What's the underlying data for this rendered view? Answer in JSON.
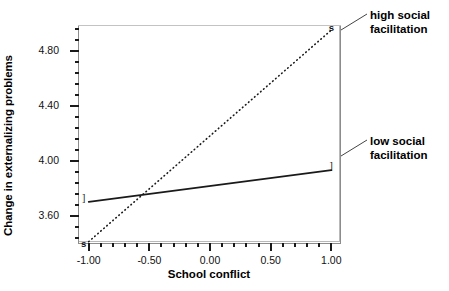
{
  "chart_data": {
    "type": "line",
    "title": "",
    "xlabel": "School conflict",
    "ylabel": "Change in externalizing problems",
    "xlim": [
      -1.08,
      1.08
    ],
    "ylim": [
      3.4,
      4.98
    ],
    "grid": false,
    "legend_position": "right-outside-annotations",
    "x": [
      -1.0,
      1.0
    ],
    "series": [
      {
        "name": "high social facilitation",
        "style": "dotted",
        "marker": "s",
        "values": [
          3.41,
          4.95
        ]
      },
      {
        "name": "low social facilitation",
        "style": "solid",
        "marker": "]",
        "values": [
          3.7,
          3.93
        ]
      }
    ],
    "xticks": [
      {
        "value": -1.0,
        "label": "-1.00"
      },
      {
        "value": -0.5,
        "label": "-0.50"
      },
      {
        "value": 0.0,
        "label": "0.00"
      },
      {
        "value": 0.5,
        "label": "0.50"
      },
      {
        "value": 1.0,
        "label": "1.00"
      }
    ],
    "yticks": [
      {
        "value": 4.8,
        "label": "4.80"
      },
      {
        "value": 4.4,
        "label": "4.40"
      },
      {
        "value": 4.0,
        "label": "4.00"
      },
      {
        "value": 3.6,
        "label": "3.60"
      }
    ],
    "x_minor_per_interval": 4,
    "y_minor_per_interval": 4
  },
  "axes": {
    "x_title": "School conflict",
    "y_title": "Change in externalizing problems"
  },
  "annotations": {
    "high": "high social\nfacilitation",
    "low": "low social\nfacilitation"
  },
  "markers": {
    "high_left": "s",
    "high_right": "s",
    "low_left": "]",
    "low_right": "]"
  },
  "colors": {
    "line": "#1a1a1a",
    "frame": "#8c8c8c",
    "text": "#000000",
    "background": "#ffffff"
  }
}
